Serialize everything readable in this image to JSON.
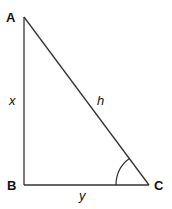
{
  "diagram": {
    "type": "right-triangle",
    "vertices": {
      "A": {
        "label": "A",
        "x": 24,
        "y": 17
      },
      "B": {
        "label": "B",
        "x": 24,
        "y": 185
      },
      "C": {
        "label": "C",
        "x": 149,
        "y": 185
      }
    },
    "sides": {
      "AB": {
        "label": "x"
      },
      "AC": {
        "label": "h"
      },
      "BC": {
        "label": "y"
      }
    },
    "angle_marker": {
      "vertex": "C",
      "radius": 33
    },
    "line_color": "#333333"
  }
}
